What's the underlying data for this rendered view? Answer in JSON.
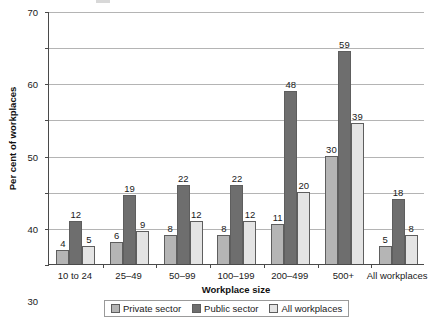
{
  "chart_data": {
    "type": "bar",
    "title": "",
    "xlabel": "Workplace size",
    "ylabel": "Per cent of workplaces",
    "ylim": [
      0,
      70
    ],
    "ytick_step": 10,
    "yticks": [
      0,
      10,
      20,
      30,
      40,
      50,
      60,
      70
    ],
    "grid": true,
    "legend_position": "bottom",
    "categories": [
      "10 to 24",
      "25–49",
      "50–99",
      "100–199",
      "200–499",
      "500+",
      "All workplaces"
    ],
    "series": [
      {
        "name": "Private sector",
        "color": "#b5b5b5",
        "values": [
          4,
          6,
          8,
          8,
          11,
          30,
          5
        ]
      },
      {
        "name": "Public sector",
        "color": "#6e6e6e",
        "values": [
          12,
          19,
          22,
          22,
          48,
          59,
          18
        ]
      },
      {
        "name": "All workplaces",
        "color": "#e4e4e4",
        "values": [
          5,
          9,
          12,
          12,
          20,
          39,
          8
        ]
      }
    ]
  },
  "style": {
    "bar_border": "#5e5e5e",
    "axis_color": "#4a4a4a",
    "grid_color": "#b4b4b4",
    "background": "#ffffff"
  }
}
